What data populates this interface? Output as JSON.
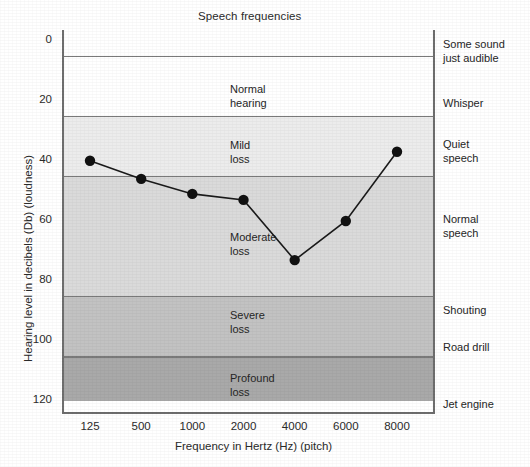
{
  "chart_data": {
    "type": "line",
    "title": "Speech frequencies",
    "xlabel": "Frequency in Hertz (Hz) (pitch)",
    "ylabel": "Hearing level in decibels (Db) (loudness)",
    "x_categories": [
      "125",
      "500",
      "1000",
      "2000",
      "4000",
      "6000",
      "8000"
    ],
    "x_values": [
      125,
      500,
      1000,
      2000,
      4000,
      6000,
      8000
    ],
    "y_ticks": [
      "0",
      "20",
      "40",
      "60",
      "80",
      "100",
      "120"
    ],
    "y_tick_values": [
      0,
      20,
      40,
      60,
      80,
      100,
      120
    ],
    "ylim": [
      0,
      120
    ],
    "y_inverted": true,
    "grid": false,
    "legend": "none",
    "series": [
      {
        "name": "Hearing threshold",
        "marker": "filled-circle",
        "values": [
          40,
          46,
          51,
          53,
          73,
          60,
          37
        ]
      }
    ],
    "bands": [
      {
        "label": "",
        "label_display": "",
        "from_db": 0,
        "to_db": 5,
        "color": "#ffffff"
      },
      {
        "label": "Normal hearing",
        "label_display": "Normal\nhearing",
        "from_db": 5,
        "to_db": 25,
        "color": "#ffffff"
      },
      {
        "label": "Mild loss",
        "label_display": "Mild\nloss",
        "from_db": 25,
        "to_db": 45,
        "color": "#ececec"
      },
      {
        "label": "Moderate loss",
        "label_display": "Moderate\nloss",
        "from_db": 45,
        "to_db": 85,
        "color": "#dadada"
      },
      {
        "label": "Severe loss",
        "label_display": "Severe\nloss",
        "from_db": 85,
        "to_db": 105,
        "color": "#c2c2c2"
      },
      {
        "label": "Profound loss",
        "label_display": "Profound\nloss",
        "from_db": 105,
        "to_db": 120,
        "color": "#a9a9a9"
      }
    ],
    "right_annotations": [
      {
        "label": "Some sound just audible",
        "label_display": "Some sound\njust audible",
        "at_db": 2
      },
      {
        "label": "Whisper",
        "label_display": "Whisper",
        "at_db": 17
      },
      {
        "label": "Quiet speech",
        "label_display": "Quiet\nspeech",
        "at_db": 37
      },
      {
        "label": "Normal speech",
        "label_display": "Normal\nspeech",
        "at_db": 59
      },
      {
        "label": "Shouting",
        "label_display": "Shouting",
        "at_db": 90
      },
      {
        "label": "Road drill",
        "label_display": "Road drill",
        "at_db": 103
      },
      {
        "label": "Jet engine",
        "label_display": "Jet engine",
        "at_db": 117
      }
    ],
    "colors": {
      "line": "#1a1a1a",
      "marker": "#111111",
      "axis": "#6e6e6e",
      "band_line": "#7a7a7a",
      "background": "#ffffff"
    }
  }
}
